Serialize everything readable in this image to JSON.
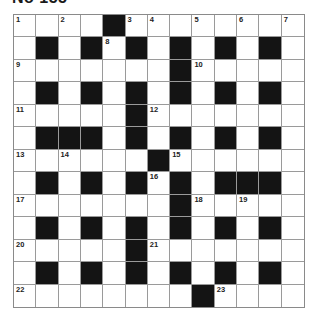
{
  "title": "No 155",
  "colors": {
    "black_square": "#141414",
    "white_square": "#ffffff",
    "grid_line": "#9a9a9a"
  },
  "grid": {
    "rows": 13,
    "cols": 13,
    "layout": [
      "....#........",
      ".#.#.#.#.#.#.",
      ".......#.....",
      ".#.#.#.#.#.#.",
      ".....#.......",
      ".###.#.#.#.#.",
      "......#......",
      ".#.#.#.#.###.",
      ".......#.....",
      ".#.#.#.#.#.#.",
      ".....#.......",
      ".#.#.#.#.#.#.",
      "........#...."
    ],
    "numbers": [
      {
        "row": 0,
        "col": 0,
        "n": "1"
      },
      {
        "row": 0,
        "col": 2,
        "n": "2"
      },
      {
        "row": 0,
        "col": 5,
        "n": "3"
      },
      {
        "row": 0,
        "col": 6,
        "n": "4"
      },
      {
        "row": 0,
        "col": 8,
        "n": "5"
      },
      {
        "row": 0,
        "col": 10,
        "n": "6"
      },
      {
        "row": 0,
        "col": 12,
        "n": "7"
      },
      {
        "row": 1,
        "col": 4,
        "n": "8"
      },
      {
        "row": 2,
        "col": 0,
        "n": "9"
      },
      {
        "row": 2,
        "col": 8,
        "n": "10"
      },
      {
        "row": 4,
        "col": 0,
        "n": "11"
      },
      {
        "row": 4,
        "col": 6,
        "n": "12"
      },
      {
        "row": 6,
        "col": 0,
        "n": "13"
      },
      {
        "row": 6,
        "col": 2,
        "n": "14"
      },
      {
        "row": 6,
        "col": 7,
        "n": "15"
      },
      {
        "row": 7,
        "col": 6,
        "n": "16"
      },
      {
        "row": 8,
        "col": 0,
        "n": "17"
      },
      {
        "row": 8,
        "col": 8,
        "n": "18"
      },
      {
        "row": 8,
        "col": 10,
        "n": "19"
      },
      {
        "row": 10,
        "col": 0,
        "n": "20"
      },
      {
        "row": 10,
        "col": 6,
        "n": "21"
      },
      {
        "row": 12,
        "col": 0,
        "n": "22"
      },
      {
        "row": 12,
        "col": 9,
        "n": "23"
      }
    ]
  }
}
